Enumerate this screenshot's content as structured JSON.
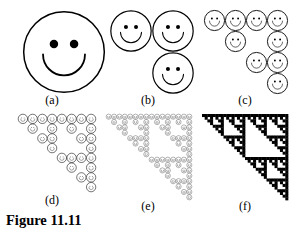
{
  "figure": {
    "caption": "Figure 11.11",
    "background_color": "#ffffff",
    "ink_color": "#000000",
    "width": 299,
    "height": 232,
    "panels": [
      {
        "id": "a",
        "label": "(a)",
        "level": 0,
        "face_count": 1,
        "grid_size": 1,
        "render_mode": "faces",
        "cells": [
          [
            0,
            0
          ]
        ],
        "box": {
          "x": 4,
          "y": 6,
          "w": 96,
          "h": 95
        },
        "art": {
          "x": 18,
          "y": 4,
          "w": 84,
          "h": 84
        },
        "label_y": 88,
        "face_style": {
          "stroke_width": 1.5,
          "eye_radius_ratio": 0.105,
          "eye_offset_x_ratio": 0.25,
          "eye_offset_y_ratio": 0.2,
          "mouth_radius_ratio": 0.52,
          "mouth_stroke_ratio": 0.045
        }
      },
      {
        "id": "b",
        "label": "(b)",
        "level": 1,
        "face_count": 3,
        "grid_size": 2,
        "render_mode": "faces",
        "cells": [
          [
            0,
            0
          ],
          [
            0,
            1
          ],
          [
            1,
            1
          ]
        ],
        "box": {
          "x": 100,
          "y": 6,
          "w": 96,
          "h": 95
        },
        "art": {
          "x": 10,
          "y": 4,
          "w": 84,
          "h": 84
        },
        "label_y": 88,
        "face_style": {
          "stroke_width": 1.2,
          "eye_radius_ratio": 0.1,
          "eye_offset_x_ratio": 0.25,
          "eye_offset_y_ratio": 0.2,
          "mouth_radius_ratio": 0.52,
          "mouth_stroke_ratio": 0.05
        }
      },
      {
        "id": "c",
        "label": "(c)",
        "level": 2,
        "face_count": 9,
        "grid_size": 4,
        "render_mode": "faces",
        "cells": [
          [
            0,
            0
          ],
          [
            0,
            1
          ],
          [
            0,
            2
          ],
          [
            0,
            3
          ],
          [
            1,
            1
          ],
          [
            1,
            3
          ],
          [
            2,
            2
          ],
          [
            2,
            3
          ],
          [
            3,
            3
          ]
        ],
        "box": {
          "x": 196,
          "y": 6,
          "w": 98,
          "h": 95
        },
        "art": {
          "x": 8,
          "y": 4,
          "w": 84,
          "h": 84
        },
        "label_y": 88,
        "face_style": {
          "stroke_width": 0.9,
          "eye_radius_ratio": 0.095,
          "eye_offset_x_ratio": 0.26,
          "eye_offset_y_ratio": 0.2,
          "mouth_radius_ratio": 0.5,
          "mouth_stroke_ratio": 0.06
        }
      },
      {
        "id": "d",
        "label": "(d)",
        "level": 3,
        "face_count": 27,
        "grid_size": 8,
        "render_mode": "faces",
        "box": {
          "x": 4,
          "y": 112,
          "w": 96,
          "h": 96
        },
        "art": {
          "x": 14,
          "y": 2,
          "w": 78,
          "h": 78
        },
        "label_y": 82,
        "face_style": {
          "stroke_width": 0.55,
          "eye_radius_ratio": 0.09,
          "eye_offset_x_ratio": 0.26,
          "eye_offset_y_ratio": 0.2,
          "mouth_radius_ratio": 0.48,
          "mouth_stroke_ratio": 0.075
        }
      },
      {
        "id": "e",
        "label": "(e)",
        "level": 4,
        "face_count": 81,
        "grid_size": 16,
        "render_mode": "faces",
        "box": {
          "x": 100,
          "y": 112,
          "w": 96,
          "h": 96
        },
        "art": {
          "x": 6,
          "y": 2,
          "w": 86,
          "h": 86
        },
        "label_y": 88,
        "face_style": {
          "stroke_width": 0.3,
          "eye_radius_ratio": 0.1,
          "eye_offset_x_ratio": 0.27,
          "eye_offset_y_ratio": 0.2,
          "mouth_radius_ratio": 0.47,
          "mouth_stroke_ratio": 0.11
        }
      },
      {
        "id": "f",
        "label": "(f)",
        "level": 5,
        "face_count": 243,
        "grid_size": 32,
        "render_mode": "solid",
        "box": {
          "x": 196,
          "y": 112,
          "w": 98,
          "h": 96
        },
        "art": {
          "x": 6,
          "y": 2,
          "w": 86,
          "h": 86
        },
        "label_y": 88,
        "face_style": {
          "stroke_width": 0,
          "eye_radius_ratio": 0,
          "eye_offset_x_ratio": 0,
          "eye_offset_y_ratio": 0,
          "mouth_radius_ratio": 0,
          "mouth_stroke_ratio": 0
        }
      }
    ]
  }
}
